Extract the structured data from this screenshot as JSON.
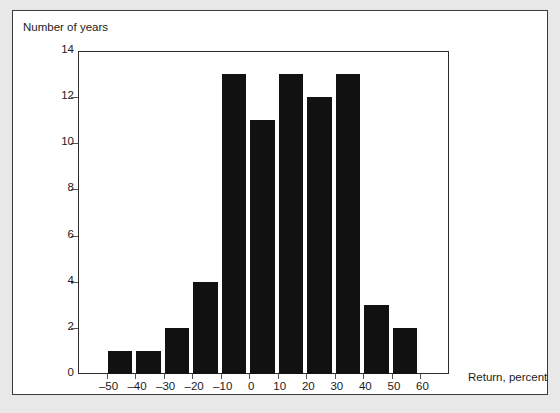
{
  "axis_titles": {
    "y": "Number of years",
    "x": "Return, percent"
  },
  "colors": {
    "bar": "#111111",
    "frame": "#2c2c2c",
    "panel_background": "#ffffff",
    "page_background": "#e8e8e8",
    "text": "#1b1b1b"
  },
  "chart_data": {
    "type": "bar",
    "title": "",
    "subtitle": "",
    "xlabel": "Return, percent",
    "ylabel": "Number of years",
    "grid": false,
    "legend": false,
    "xlim": [
      -60,
      70
    ],
    "ylim": [
      0,
      14
    ],
    "bin_width": 10,
    "y_ticks": [
      0,
      2,
      4,
      6,
      8,
      10,
      12,
      14
    ],
    "y_tick_labels": [
      "0",
      "2",
      "4",
      "6",
      "8",
      "10",
      "12",
      "14"
    ],
    "x_ticks": [
      -50,
      -40,
      -30,
      -20,
      -10,
      0,
      10,
      20,
      30,
      40,
      50,
      60
    ],
    "x_tick_labels": [
      "–50",
      "–40",
      "–30",
      "–20",
      "–10",
      "0",
      "10",
      "20",
      "30",
      "40",
      "50",
      "60"
    ],
    "categories": [
      "–50",
      "–40",
      "–30",
      "–20",
      "–10",
      "0",
      "10",
      "20",
      "30",
      "40",
      "50",
      "60"
    ],
    "bin_starts": [
      -50,
      -40,
      -30,
      -20,
      -10,
      0,
      10,
      20,
      30,
      40,
      50,
      60
    ],
    "values": [
      1,
      1,
      2,
      4,
      13,
      11,
      13,
      12,
      13,
      3,
      2,
      0
    ]
  }
}
